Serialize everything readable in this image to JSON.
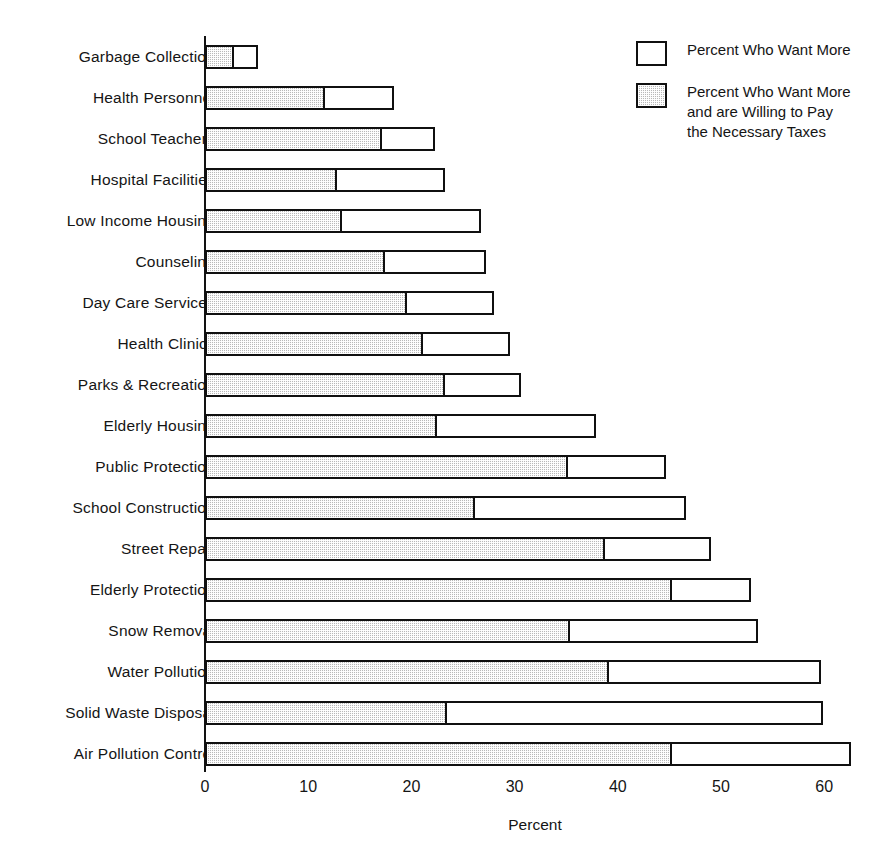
{
  "chart_data": {
    "type": "bar",
    "orientation": "horizontal",
    "stacked": true,
    "title": "",
    "xlabel": "Percent",
    "ylabel": "",
    "xlim": [
      0,
      64
    ],
    "xticks": [
      0,
      10,
      20,
      30,
      40,
      50,
      60
    ],
    "xticklabels": [
      "0",
      "10",
      "20",
      "30",
      "40",
      "50",
      "60"
    ],
    "grid": false,
    "legend_position": "top-right",
    "categories": [
      "Garbage Collection",
      "Health Personnel",
      "School Teachers",
      "Hospital Facilities",
      "Low Income Housing",
      "Counseling",
      "Day Care Services",
      "Health Clinics",
      "Parks & Recreation",
      "Elderly Housing",
      "Public Protection",
      "School Construction",
      "Street Repair",
      "Elderly Protection",
      "Snow Removal",
      "Water Pollution",
      "Solid Waste Disposal",
      "Air Pollution Control"
    ],
    "series": [
      {
        "name": "Percent Who Want More and are Willing to Pay the Necessary Taxes",
        "fill": "hatched-gray",
        "color": "#b9b9b9",
        "values": [
          2.6,
          11.4,
          17.0,
          12.6,
          13.1,
          17.2,
          19.4,
          20.9,
          23.1,
          22.3,
          35.0,
          26.0,
          38.6,
          45.1,
          35.2,
          39.0,
          23.3,
          45.1
        ]
      },
      {
        "name": "Percent Who Want More",
        "fill": "white",
        "color": "#ffffff",
        "values": [
          5.1,
          18.3,
          22.3,
          23.3,
          26.7,
          27.2,
          28.0,
          29.6,
          30.6,
          37.9,
          44.7,
          46.6,
          49.0,
          52.9,
          53.6,
          59.7,
          59.9,
          62.6
        ],
        "note": "total bar length (outer, white outline) — includes the hatched portion"
      }
    ],
    "legend": [
      {
        "label": "Percent Who Want More",
        "swatch": "white"
      },
      {
        "label": "Percent Who Want More\nand are Willing to Pay\nthe Necessary Taxes",
        "swatch": "hatched-gray"
      }
    ]
  }
}
